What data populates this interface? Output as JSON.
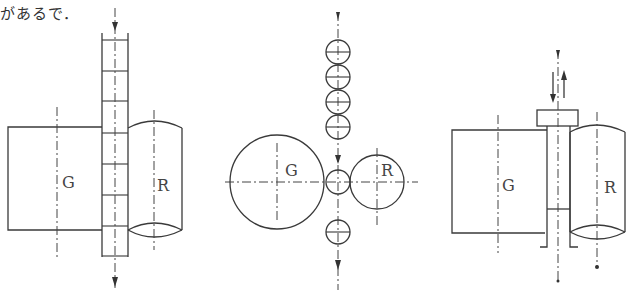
{
  "caption": "があるで．",
  "figures": [
    {
      "id": "figure-left",
      "description": "Through-feed strip between grinding wheel and regulating wheel (side view)",
      "labels": {
        "grinding_wheel": "G",
        "regulating_wheel": "R"
      }
    },
    {
      "id": "figure-middle",
      "description": "End view: balls fed vertically between grinding wheel and regulating wheel",
      "labels": {
        "grinding_wheel": "G",
        "regulating_wheel": "R"
      }
    },
    {
      "id": "figure-right",
      "description": "Plunge/headed workpiece fed in and out between wheels (side view)",
      "labels": {
        "grinding_wheel": "G",
        "regulating_wheel": "R"
      }
    }
  ],
  "colors": {
    "line": "#3a3a3a",
    "background": "#ffffff"
  }
}
